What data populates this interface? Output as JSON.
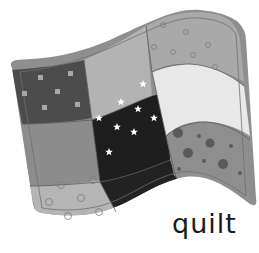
{
  "caption": {
    "text": "quilt"
  },
  "illustration": {
    "subject": "quilt",
    "grid": "3x3",
    "colors": {
      "border": "#8f8f8f",
      "seam": "#6a6a6a",
      "top_left": "#4c4c4c",
      "top_middle": "#b3b3b3",
      "top_right": "#a9a9a9",
      "middle_left": "#8c8c8c",
      "center": "#1e1e1e",
      "middle_right": "#e8e8e8",
      "bottom_left": "#b5b5b5",
      "bottom_center": "#222222",
      "bottom_right": "#8e8e8e"
    },
    "patches": [
      {
        "position": "top-left",
        "pattern": "light-squares"
      },
      {
        "position": "top-middle",
        "pattern": "plain"
      },
      {
        "position": "top-right",
        "pattern": "small-circles"
      },
      {
        "position": "middle-left",
        "pattern": "plain"
      },
      {
        "position": "center",
        "pattern": "white-stars"
      },
      {
        "position": "middle-right",
        "pattern": "plain"
      },
      {
        "position": "bottom-left",
        "pattern": "circle-outlines"
      },
      {
        "position": "bottom-center",
        "pattern": "plain"
      },
      {
        "position": "bottom-right",
        "pattern": "dark-dots"
      }
    ]
  }
}
